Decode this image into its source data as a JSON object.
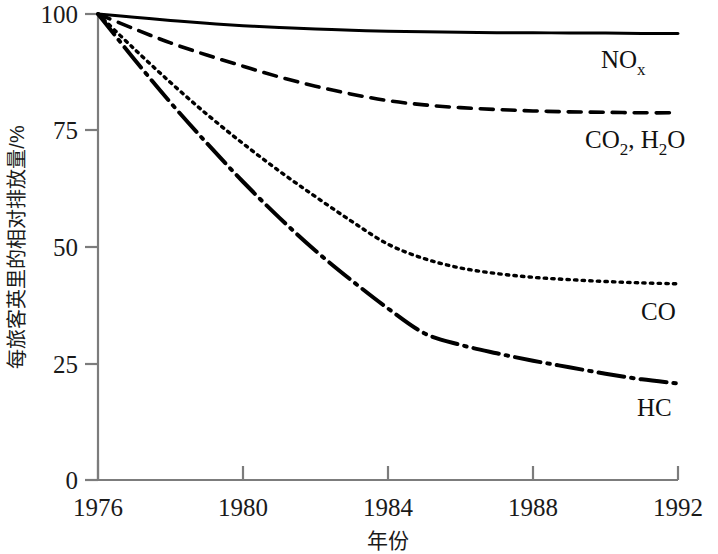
{
  "chart_data": {
    "type": "line",
    "title": "",
    "subtitle": "",
    "xlabel": "年份",
    "ylabel": "每旅客英里的相对排放量/%",
    "xlim": [
      1976,
      1992
    ],
    "ylim": [
      0,
      100
    ],
    "xticks": [
      1976,
      1980,
      1984,
      1988,
      1992
    ],
    "xtick_labels": [
      "1976",
      "1980",
      "1984",
      "1988",
      "1992"
    ],
    "yticks": [
      0,
      25,
      50,
      75,
      100
    ],
    "ytick_labels": [
      "0",
      "25",
      "50",
      "75",
      "100"
    ],
    "grid": false,
    "legend_position": "inline-right-of-line-ends",
    "x": [
      1976,
      1977,
      1978,
      1979,
      1980,
      1981,
      1982,
      1983,
      1984,
      1985,
      1986,
      1987,
      1988,
      1989,
      1990,
      1991,
      1992
    ],
    "series": [
      {
        "name": "NOx",
        "label_html": "NO<sub>x</sub>",
        "label_main": "NO",
        "label_sub": "x",
        "linestyle": "solid",
        "color": "#000000",
        "values": [
          100,
          99.3,
          98.6,
          98.0,
          97.5,
          97.1,
          96.8,
          96.5,
          96.3,
          96.2,
          96.1,
          96.0,
          96.0,
          95.9,
          95.9,
          95.8,
          95.8
        ]
      },
      {
        "name": "CO2, H2O",
        "label_html": "CO<sub>2</sub>, H<sub>2</sub>O",
        "linestyle": "dashed",
        "color": "#000000",
        "values": [
          100,
          96.8,
          93.8,
          91.2,
          88.8,
          86.5,
          84.5,
          82.8,
          81.4,
          80.5,
          79.9,
          79.5,
          79.2,
          79.0,
          78.9,
          78.8,
          78.8
        ]
      },
      {
        "name": "CO",
        "label_html": "CO",
        "linestyle": "dotted",
        "color": "#000000",
        "values": [
          100,
          92.5,
          85.3,
          78.5,
          72.2,
          66.3,
          60.8,
          55.5,
          50.6,
          47.5,
          45.5,
          44.3,
          43.5,
          43.0,
          42.6,
          42.3,
          42.1
        ]
      },
      {
        "name": "HC",
        "label_html": "HC",
        "linestyle": "dashdot",
        "color": "#000000",
        "values": [
          100,
          90.3,
          81.0,
          72.3,
          64.0,
          56.3,
          49.2,
          42.8,
          36.8,
          31.5,
          29.0,
          27.2,
          25.6,
          24.2,
          22.8,
          21.6,
          20.7
        ]
      }
    ]
  },
  "axes": {
    "y_label": "每旅客英里的相对排放量/%",
    "x_label": "年份",
    "y_ticks": [
      "100",
      "75",
      "50",
      "25",
      "0"
    ],
    "x_ticks": [
      "1976",
      "1980",
      "1984",
      "1988",
      "1992"
    ]
  },
  "series_labels": {
    "nox_main": "NO",
    "nox_sub": "x",
    "co2_main": "CO",
    "co2_sub_1": "2",
    "co2_mid": ", H",
    "co2_sub_2": "2",
    "co2_end": "O",
    "co": "CO",
    "hc": "HC"
  },
  "colors": {
    "background": "#ffffff",
    "axis": "#7c7c7c",
    "line": "#000000",
    "text": "#111111"
  }
}
